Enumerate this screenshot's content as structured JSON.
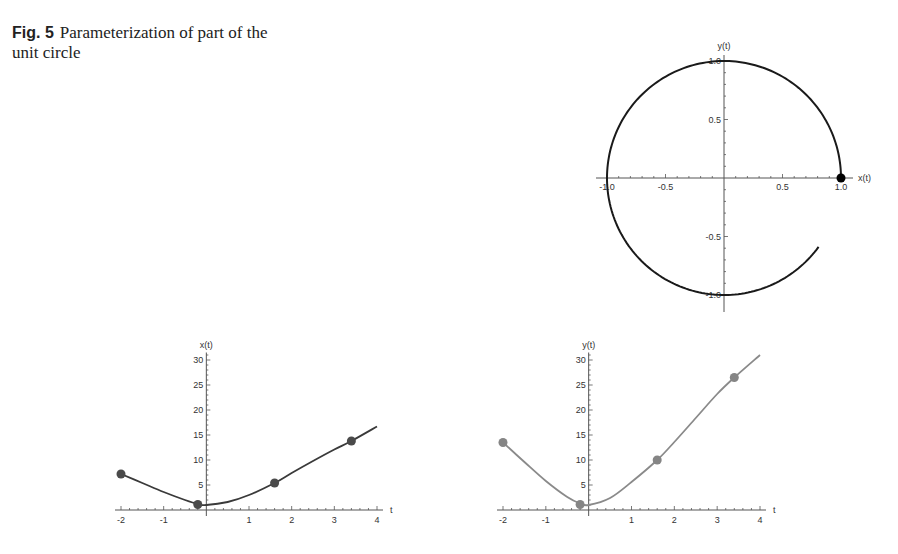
{
  "caption": {
    "label": "Fig. 5",
    "text": "Parameterization of part of the unit circle"
  },
  "chart_data": [
    {
      "id": "circle",
      "type": "line",
      "title": "",
      "xlabel": "x(t)",
      "ylabel": "y(t)",
      "xlim": [
        -1.1,
        1.1
      ],
      "ylim": [
        -1.1,
        1.1
      ],
      "xticks": [
        "-1.0",
        "-0.5",
        "0.5",
        "1.0"
      ],
      "yticks": [
        "1.0",
        "0.5",
        "-0.5",
        "-1.0"
      ],
      "grid": false,
      "series": [
        {
          "name": "parametric curve (x(t), y(t))",
          "description": "Unit circle arc, counterclockwise from (1,0) to approx (0.81,-0.59)",
          "start": [
            1.0,
            0.0
          ],
          "end": [
            0.81,
            -0.59
          ],
          "color": "#1a1a1a"
        }
      ],
      "points": [
        {
          "x": 1.0,
          "y": 0.0,
          "color": "#000000"
        }
      ]
    },
    {
      "id": "x-of-t",
      "type": "line",
      "title": "",
      "xlabel": "t",
      "ylabel": "x(t)",
      "xlim": [
        -2,
        4
      ],
      "ylim": [
        0,
        31
      ],
      "xticks": [
        "-2",
        "-1",
        "1",
        "2",
        "3",
        "4"
      ],
      "yticks": [
        "5",
        "10",
        "15",
        "20",
        "25",
        "30"
      ],
      "grid": false,
      "series": [
        {
          "name": "x(t)",
          "color": "#3a3a3a",
          "x": [
            -2,
            -1.5,
            -1,
            -0.5,
            -0.2,
            0,
            0.5,
            1,
            1.6,
            2,
            2.5,
            3,
            3.4,
            4
          ],
          "y": [
            7.2,
            5.4,
            3.6,
            2.0,
            1.2,
            1.0,
            1.6,
            3.0,
            5.4,
            7.4,
            9.8,
            12.1,
            13.8,
            16.7
          ]
        }
      ],
      "points": [
        {
          "x": -2,
          "y": 7.2
        },
        {
          "x": -0.2,
          "y": 1.1
        },
        {
          "x": 1.6,
          "y": 5.4
        },
        {
          "x": 3.4,
          "y": 13.8
        }
      ]
    },
    {
      "id": "y-of-t",
      "type": "line",
      "title": "",
      "xlabel": "t",
      "ylabel": "y(t)",
      "xlim": [
        -2,
        4
      ],
      "ylim": [
        0,
        31
      ],
      "xticks": [
        "-2",
        "-1",
        "1",
        "2",
        "3",
        "4"
      ],
      "yticks": [
        "5",
        "10",
        "15",
        "20",
        "25",
        "30"
      ],
      "grid": false,
      "series": [
        {
          "name": "y(t)",
          "color": "#8a8a8a",
          "x": [
            -2,
            -1.5,
            -1,
            -0.5,
            -0.2,
            0,
            0.5,
            1,
            1.6,
            2,
            2.5,
            3,
            3.4,
            4
          ],
          "y": [
            13.5,
            9.6,
            5.8,
            2.6,
            1.3,
            1.0,
            2.4,
            5.6,
            10.0,
            13.6,
            18.4,
            23.2,
            26.5,
            31.0
          ]
        }
      ],
      "points": [
        {
          "x": -2,
          "y": 13.5
        },
        {
          "x": -0.2,
          "y": 1.1
        },
        {
          "x": 1.6,
          "y": 10.0
        },
        {
          "x": 3.4,
          "y": 26.5
        }
      ]
    }
  ]
}
